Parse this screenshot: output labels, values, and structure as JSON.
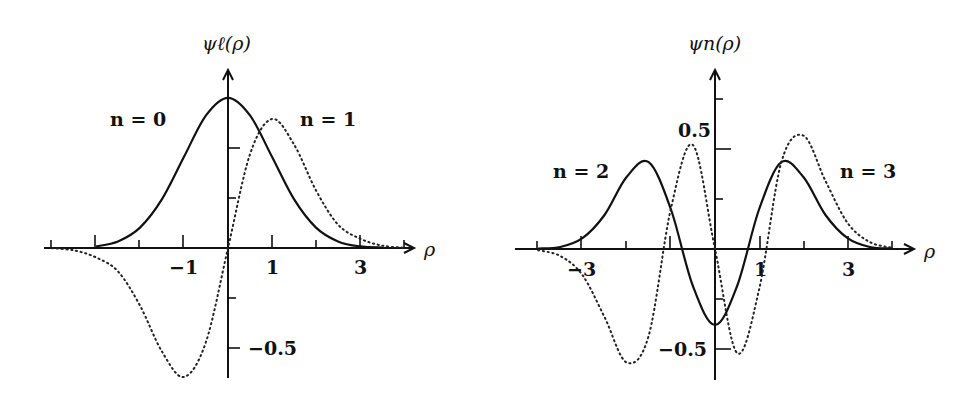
{
  "chart_data": [
    {
      "type": "line",
      "title": "ψℓ(ρ)",
      "ylabel": "ψℓ(ρ)",
      "xlabel": "ρ",
      "xlim": [
        -4.2,
        4.2
      ],
      "ylim": [
        -0.65,
        0.85
      ],
      "x_tick_labels": [
        "-1",
        "1",
        "3"
      ],
      "x_tick_positions": [
        -4,
        -3,
        -2,
        -1,
        0,
        1,
        2,
        3,
        4
      ],
      "y_tick_labels": [
        "-0.5"
      ],
      "y_tick_positions": [
        0.5,
        0.25,
        -0.25,
        -0.5
      ],
      "grid": false,
      "annotations": [
        "n = 0",
        "n = 1"
      ],
      "x": [
        -4,
        -3.5,
        -3,
        -2.5,
        -2,
        -1.5,
        -1,
        -0.5,
        0,
        0.5,
        1,
        1.5,
        2,
        2.5,
        3,
        3.5,
        4
      ],
      "series": [
        {
          "name": "n = 0",
          "style": "solid",
          "values": [
            0.0,
            0.002,
            0.008,
            0.033,
            0.102,
            0.244,
            0.456,
            0.663,
            0.751,
            0.663,
            0.456,
            0.244,
            0.102,
            0.033,
            0.008,
            0.002,
            0.0
          ]
        },
        {
          "name": "n = 1",
          "style": "dotted",
          "values": [
            -0.001,
            -0.012,
            -0.047,
            -0.117,
            -0.288,
            -0.518,
            -0.645,
            -0.469,
            0.0,
            0.469,
            0.645,
            0.518,
            0.288,
            0.117,
            0.047,
            0.012,
            0.001
          ]
        }
      ]
    },
    {
      "type": "line",
      "title": "ψn(ρ)",
      "ylabel": "ψn(ρ)",
      "xlabel": "ρ",
      "xlim": [
        -4.2,
        4.2
      ],
      "ylim": [
        -0.65,
        0.85
      ],
      "x_tick_labels": [
        "-3",
        "1",
        "3"
      ],
      "x_tick_positions": [
        -4,
        -3,
        -2,
        -1,
        0,
        1,
        2,
        3,
        4
      ],
      "y_tick_labels": [
        "0.5",
        "-0.5"
      ],
      "y_tick_positions": [
        0.75,
        0.5,
        0.25,
        -0.25,
        -0.5
      ],
      "grid": false,
      "annotations": [
        "n = 2",
        "n = 3"
      ],
      "x": [
        -4,
        -3.5,
        -3,
        -2.5,
        -2,
        -1.5,
        -1,
        -0.5,
        0,
        0.5,
        1,
        1.5,
        2,
        2.5,
        3,
        3.5,
        4
      ],
      "series": [
        {
          "name": "n = 2",
          "style": "solid",
          "values": [
            0.002,
            0.01,
            0.054,
            0.17,
            0.36,
            0.434,
            0.2,
            -0.185,
            -0.38,
            -0.185,
            0.2,
            0.434,
            0.36,
            0.17,
            0.054,
            0.01,
            0.002
          ]
        },
        {
          "name": "n = 3",
          "style": "dotted",
          "values": [
            -0.006,
            -0.035,
            -0.13,
            -0.34,
            -0.567,
            -0.433,
            0.2,
            0.52,
            0.0,
            -0.52,
            -0.2,
            0.433,
            0.567,
            0.34,
            0.13,
            0.035,
            0.006
          ]
        }
      ]
    }
  ],
  "left": {
    "title": "ψℓ(ρ)",
    "xaxis_label": "ρ",
    "label_n0": "n = 0",
    "label_n1": "n = 1",
    "xtick_m1": "−1",
    "xtick_1": "1",
    "xtick_3": "3",
    "ytick_m05": "−0.5"
  },
  "right": {
    "title": "ψn(ρ)",
    "xaxis_label": "ρ",
    "label_n2": "n = 2",
    "label_n3": "n = 3",
    "xtick_m3": "−3",
    "xtick_1": "1",
    "xtick_3": "3",
    "ytick_05": "0.5",
    "ytick_m05": "−0.5"
  }
}
